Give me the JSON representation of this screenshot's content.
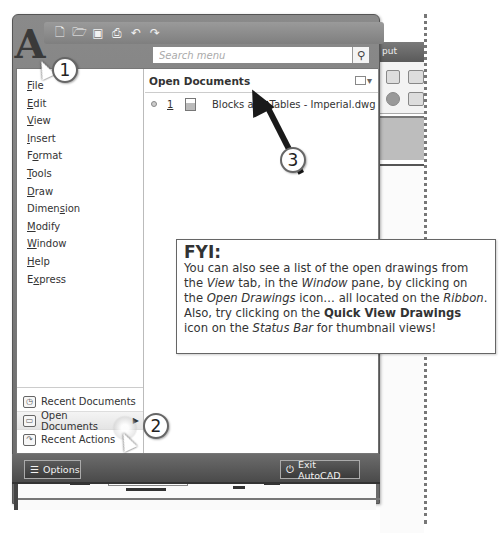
{
  "app": {
    "logo_letter": "A",
    "quick_access_toolbar": [
      {
        "name": "new-icon",
        "glyph": "▭"
      },
      {
        "name": "open-icon",
        "glyph": "▱"
      },
      {
        "name": "save-icon",
        "glyph": "▪"
      },
      {
        "name": "print-icon",
        "glyph": "⎙"
      },
      {
        "name": "undo-icon",
        "glyph": "↶"
      },
      {
        "name": "redo-icon",
        "glyph": "↷"
      }
    ],
    "ribbon_tab_fragment": "put"
  },
  "search": {
    "placeholder": "Search menu",
    "icon": "magnifier-icon"
  },
  "menu": {
    "items": [
      {
        "label": "File",
        "mnemonic_index": 0
      },
      {
        "label": "Edit",
        "mnemonic_index": 0
      },
      {
        "label": "View",
        "mnemonic_index": 0
      },
      {
        "label": "Insert",
        "mnemonic_index": 0
      },
      {
        "label": "Format",
        "mnemonic_index": 1
      },
      {
        "label": "Tools",
        "mnemonic_index": 0
      },
      {
        "label": "Draw",
        "mnemonic_index": 0
      },
      {
        "label": "Dimension",
        "mnemonic_index": 5
      },
      {
        "label": "Modify",
        "mnemonic_index": 0
      },
      {
        "label": "Window",
        "mnemonic_index": 0
      },
      {
        "label": "Help",
        "mnemonic_index": 0
      },
      {
        "label": "Express",
        "mnemonic_index": 1
      }
    ],
    "bottom_items": [
      {
        "label": "Recent Documents",
        "icon": "recent-documents-icon",
        "active": false
      },
      {
        "label": "Open Documents",
        "icon": "open-documents-icon",
        "active": true
      },
      {
        "label": "Recent Actions",
        "icon": "recent-actions-icon",
        "active": false
      }
    ]
  },
  "open_documents": {
    "header": "Open Documents",
    "view_button_icon": "display-view-icon",
    "documents": [
      {
        "number": "1",
        "name": "Blocks and Tables - Imperial.dwg"
      }
    ]
  },
  "footer": {
    "options_label": "Options",
    "exit_label": "Exit AutoCAD"
  },
  "callouts": [
    "1",
    "2",
    "3"
  ],
  "fyi": {
    "title": "FYI:",
    "segments": [
      {
        "text": "You can also see a list of the open drawings from the ",
        "style": "normal"
      },
      {
        "text": "View",
        "style": "italic"
      },
      {
        "text": " tab, in the ",
        "style": "normal"
      },
      {
        "text": "Window",
        "style": "italic"
      },
      {
        "text": " pane, by clicking on the ",
        "style": "normal"
      },
      {
        "text": "Open Drawings",
        "style": "italic"
      },
      {
        "text": " icon… all located on the ",
        "style": "normal"
      },
      {
        "text": "Ribbon",
        "style": "italic"
      },
      {
        "text": ". Also, try clicking on the ",
        "style": "normal"
      },
      {
        "text": "Quick View Drawings",
        "style": "bold"
      },
      {
        "text": " icon on the ",
        "style": "normal"
      },
      {
        "text": "Status Bar",
        "style": "italic"
      },
      {
        "text": " for thumbnail views!",
        "style": "normal"
      }
    ]
  }
}
